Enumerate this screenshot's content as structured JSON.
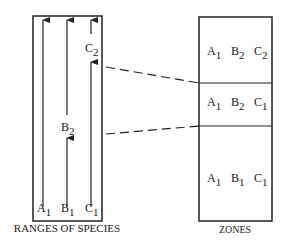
{
  "diagram": {
    "left_panel": {
      "caption": "RANGES OF SPECIES",
      "species": [
        {
          "letter": "A",
          "sub": "1",
          "id": "A1"
        },
        {
          "letter": "B",
          "sub": "1",
          "id": "B1"
        },
        {
          "letter": "C",
          "sub": "1",
          "id": "C1"
        },
        {
          "letter": "B",
          "sub": "2",
          "id": "B2"
        },
        {
          "letter": "C",
          "sub": "2",
          "id": "C2"
        }
      ]
    },
    "right_panel": {
      "caption": "ZONES",
      "zones": [
        {
          "position": "top",
          "taxa": [
            {
              "letter": "A",
              "sub": "1"
            },
            {
              "letter": "B",
              "sub": "2"
            },
            {
              "letter": "C",
              "sub": "2"
            }
          ]
        },
        {
          "position": "middle",
          "taxa": [
            {
              "letter": "A",
              "sub": "1"
            },
            {
              "letter": "B",
              "sub": "2"
            },
            {
              "letter": "C",
              "sub": "1"
            }
          ]
        },
        {
          "position": "bottom",
          "taxa": [
            {
              "letter": "A",
              "sub": "1"
            },
            {
              "letter": "B",
              "sub": "1"
            },
            {
              "letter": "C",
              "sub": "1"
            }
          ]
        }
      ]
    },
    "colors": {
      "stroke": "#222222",
      "background": "#ffffff"
    }
  }
}
